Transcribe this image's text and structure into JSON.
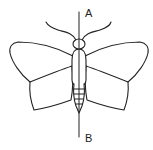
{
  "figure": {
    "stroke_color": "#222222",
    "background_color": "#ffffff",
    "axis": {
      "top_label": "A",
      "bottom_label": "B"
    },
    "parts": {
      "antennae": "antennae",
      "head": "head",
      "thorax": "thorax",
      "abdomen": "abdomen",
      "forewings": "forewings",
      "hindwings": "hindwings",
      "symmetry_line": "line of symmetry AB"
    }
  }
}
